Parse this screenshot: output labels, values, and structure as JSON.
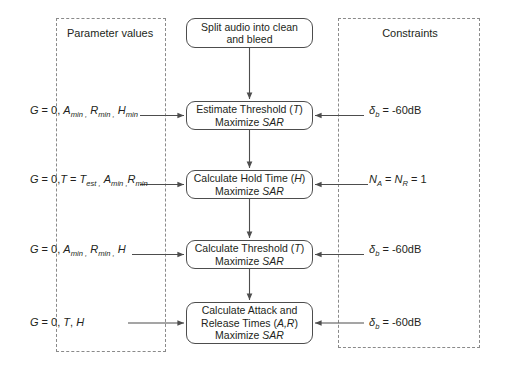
{
  "diagram": {
    "title_left": "Parameter values",
    "title_right": "Constraints",
    "process_boxes": [
      {
        "id": "split",
        "lines": [
          "Split audio into clean",
          "and bleed"
        ]
      },
      {
        "id": "estimate-threshold",
        "lines": [
          "Estimate Threshold (T)",
          "Maximize SAR"
        ]
      },
      {
        "id": "calculate-hold-time",
        "lines": [
          "Calculate Hold Time (H)",
          "Maximize SAR"
        ]
      },
      {
        "id": "calculate-threshold",
        "lines": [
          "Calculate Threshold (T)",
          "Maximize SAR"
        ]
      },
      {
        "id": "calculate-attack-release",
        "lines": [
          "Calculate Attack and",
          "Release Times (A,R)",
          "Maximize SAR"
        ]
      }
    ],
    "parameter_values": [
      "G = 0, Amin , Rmin , Hmin",
      "G = 0,T = Test , Amin , Rmin",
      "G = 0, Amin , Rmin , H",
      "G = 0, T, H"
    ],
    "constraints": [
      "δb = -60dB",
      "NA = NR = 1",
      "δb = -60dB",
      "δb = -60dB"
    ],
    "colors": {
      "stroke": "#4d4d4d",
      "dashed_stroke": "#8a8a8a",
      "text": "#231f20",
      "background": "#ffffff"
    }
  }
}
